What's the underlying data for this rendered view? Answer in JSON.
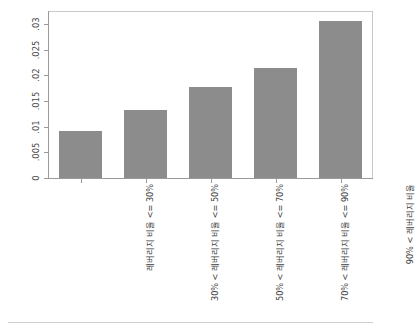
{
  "chart_data": {
    "type": "bar",
    "title": "",
    "subtitle": "",
    "xlabel": "",
    "ylabel": "주택 자산 변화에 따른 한계 소비 성향",
    "ylabel_line1": "주택 자산 변화에 따른 한계 소비 성향",
    "ylabel_line2": "(자동차 구입의 경우)",
    "categories": [
      "레버리지 비율 <= 30%",
      "30% < 레버리지 비율 <= 50%",
      "50% < 레버리지 비율 <= 70%",
      "70% < 레버리지 비율 <= 90%",
      "90% < 레버리지 비율"
    ],
    "values": [
      0.0092,
      0.0132,
      0.0177,
      0.0215,
      0.0305
    ],
    "ylim": [
      0,
      0.0325
    ],
    "yticks": [
      0,
      0.005,
      0.01,
      0.015,
      0.02,
      0.025,
      0.03
    ],
    "ytick_labels": [
      "0",
      ".005",
      ".01",
      ".015",
      ".02",
      ".025",
      ".03"
    ],
    "grid": false,
    "legend": null,
    "legend_position": "none",
    "bar_color": "#8c8c8c",
    "axis_color": "#9a9a9a",
    "frame_color": "#c9c9c9",
    "text_color": "#3f3f3f"
  }
}
